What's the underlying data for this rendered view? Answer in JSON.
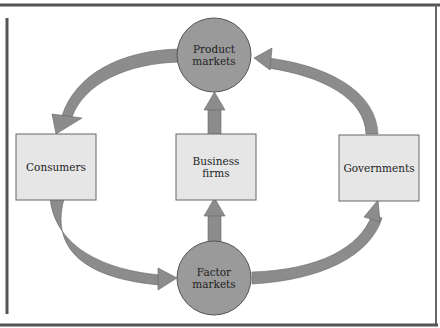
{
  "diagram": {
    "nodes": {
      "product_markets": {
        "label_line1": "Product",
        "label_line2": "markets",
        "shape": "circle"
      },
      "factor_markets": {
        "label_line1": "Factor",
        "label_line2": "markets",
        "shape": "circle"
      },
      "consumers": {
        "label": "Consumers",
        "shape": "box"
      },
      "business_firms": {
        "label_line1": "Business",
        "label_line2": "firms",
        "shape": "box"
      },
      "governments": {
        "label": "Governments",
        "shape": "box"
      }
    },
    "edges": [
      {
        "from": "product_markets",
        "to": "consumers"
      },
      {
        "from": "governments",
        "to": "product_markets"
      },
      {
        "from": "business_firms",
        "to": "product_markets"
      },
      {
        "from": "factor_markets",
        "to": "business_firms"
      },
      {
        "from": "consumers",
        "to": "factor_markets"
      },
      {
        "from": "factor_markets",
        "to": "governments"
      }
    ],
    "colors": {
      "circle_fill": "#9a9a9a",
      "box_fill": "#e6e6e6",
      "arrow_fill": "#8c8c8c",
      "border": "#555555"
    }
  }
}
